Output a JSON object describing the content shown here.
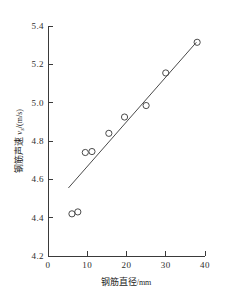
{
  "chart_data": {
    "type": "scatter",
    "title": "",
    "xlabel": "钢筋直径/mm",
    "ylabel": "钢筋声速 vs /(m/s)",
    "ylabel_parts": {
      "name": "钢筋声速",
      "symbol": "v",
      "subscript": "s",
      "unit": "/(m/s)"
    },
    "xlabel_parts": {
      "name": "钢筋直径",
      "unit": "/mm"
    },
    "xlim": [
      0,
      40
    ],
    "ylim": [
      4.2,
      5.4
    ],
    "xticks": [
      0,
      10,
      20,
      30,
      40
    ],
    "xtick_labels": [
      "0",
      "10",
      "20",
      "30",
      "40"
    ],
    "yticks": [
      4.2,
      4.4,
      4.6,
      4.8,
      5.0,
      5.2,
      5.4
    ],
    "ytick_labels": [
      "4.2",
      "4.4",
      "4.6",
      "4.8",
      "5.0",
      "5.2",
      "5.4"
    ],
    "grid": false,
    "legend": false,
    "marker": "open-circle",
    "series": [
      {
        "name": "实测点",
        "x": [
          6.1,
          7.6,
          9.5,
          11.2,
          15.5,
          19.5,
          25.0,
          30.0,
          38.0
        ],
        "y": [
          4.42,
          4.43,
          4.74,
          4.745,
          4.84,
          4.925,
          4.985,
          5.155,
          5.315
        ]
      }
    ],
    "fit_line": {
      "name": "拟合直线",
      "x": [
        5.2,
        37.8
      ],
      "y": [
        4.555,
        5.315
      ]
    },
    "colors": {
      "axis": "#3a3a3a",
      "marker": "#4a4a4a",
      "line": "#4a4a4a",
      "text": "#1e1e1e",
      "background": "#ffffff"
    }
  }
}
